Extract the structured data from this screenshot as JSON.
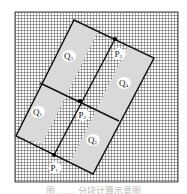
{
  "figure": {
    "grid_region": {
      "x": 15,
      "y": 12,
      "width": 163,
      "height": 170,
      "cell": 3
    },
    "rectangle": {
      "top": [
        74,
        20
      ],
      "right": [
        154,
        58
      ],
      "bottom": [
        93,
        174
      ],
      "left": [
        16,
        136
      ]
    },
    "labels": {
      "Q3": "Q",
      "Q3_sub": "3",
      "Q4": "Q",
      "Q4_sub": "4",
      "Q1": "Q",
      "Q1_sub": "1",
      "Q2": "Q",
      "Q2_sub": "2",
      "P1": "P",
      "P1_sub": "1",
      "P2": "P",
      "P2_sub": "2",
      "P3": "P",
      "P3_sub": "3"
    },
    "caption": "图 …… 分块计算示意图"
  },
  "colors": {
    "grid_line": "#555555",
    "shade": "#d9d9d9",
    "outline": "#111111",
    "label_bg": "#ffffff"
  }
}
